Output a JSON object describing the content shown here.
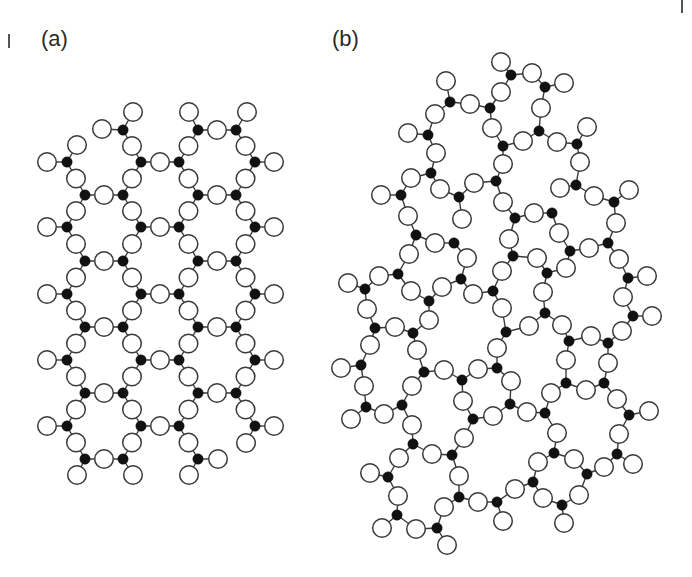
{
  "figure": {
    "panels": [
      {
        "id": "a",
        "label": "(a)",
        "title": "crystalline network",
        "label_pos": [
          41,
          28
        ]
      },
      {
        "id": "b",
        "label": "(b)",
        "title": "amorphous network",
        "label_pos": [
          332,
          28
        ]
      }
    ],
    "legend": {
      "filled_circle": "Si (network former)",
      "open_circle": "O (bridging/terminal)"
    },
    "style": {
      "oxygen_radius": 9.3,
      "silicon_radius": 5.2,
      "bond_color": "#3a3a3a",
      "silicon_color": "#111111",
      "oxygen_fill": "#ffffff"
    }
  },
  "panel_a": {
    "si": [
      [
        67,
        162
      ],
      [
        67,
        227
      ],
      [
        67,
        294
      ],
      [
        67,
        360
      ],
      [
        67,
        426
      ],
      [
        85,
        195
      ],
      [
        85,
        261
      ],
      [
        85,
        327
      ],
      [
        85,
        393
      ],
      [
        85,
        459
      ],
      [
        123,
        130
      ],
      [
        123,
        195
      ],
      [
        123,
        261
      ],
      [
        123,
        327
      ],
      [
        123,
        393
      ],
      [
        123,
        459
      ],
      [
        141,
        162
      ],
      [
        141,
        227
      ],
      [
        141,
        294
      ],
      [
        141,
        360
      ],
      [
        141,
        426
      ],
      [
        179,
        162
      ],
      [
        179,
        227
      ],
      [
        179,
        294
      ],
      [
        179,
        360
      ],
      [
        179,
        426
      ],
      [
        198,
        130
      ],
      [
        198,
        195
      ],
      [
        198,
        261
      ],
      [
        198,
        327
      ],
      [
        198,
        393
      ],
      [
        198,
        459
      ],
      [
        236,
        130
      ],
      [
        236,
        195
      ],
      [
        236,
        261
      ],
      [
        236,
        327
      ],
      [
        236,
        393
      ],
      [
        255,
        162
      ],
      [
        255,
        227
      ],
      [
        255,
        294
      ],
      [
        255,
        360
      ],
      [
        255,
        426
      ]
    ],
    "bonds": [
      [
        [
          85,
          195
        ],
        [
          123,
          195
        ]
      ],
      [
        [
          85,
          261
        ],
        [
          123,
          261
        ]
      ],
      [
        [
          85,
          327
        ],
        [
          123,
          327
        ]
      ],
      [
        [
          85,
          393
        ],
        [
          123,
          393
        ]
      ],
      [
        [
          85,
          459
        ],
        [
          123,
          459
        ]
      ],
      [
        [
          141,
          162
        ],
        [
          179,
          162
        ]
      ],
      [
        [
          141,
          227
        ],
        [
          179,
          227
        ]
      ],
      [
        [
          141,
          294
        ],
        [
          179,
          294
        ]
      ],
      [
        [
          141,
          360
        ],
        [
          179,
          360
        ]
      ],
      [
        [
          141,
          426
        ],
        [
          179,
          426
        ]
      ],
      [
        [
          198,
          130
        ],
        [
          236,
          130
        ]
      ],
      [
        [
          198,
          195
        ],
        [
          236,
          195
        ]
      ],
      [
        [
          198,
          261
        ],
        [
          236,
          261
        ]
      ],
      [
        [
          198,
          327
        ],
        [
          236,
          327
        ]
      ],
      [
        [
          198,
          393
        ],
        [
          236,
          393
        ]
      ],
      [
        [
          67,
          162
        ],
        [
          85,
          195
        ]
      ],
      [
        [
          85,
          195
        ],
        [
          67,
          227
        ]
      ],
      [
        [
          67,
          227
        ],
        [
          85,
          261
        ]
      ],
      [
        [
          85,
          261
        ],
        [
          67,
          294
        ]
      ],
      [
        [
          67,
          294
        ],
        [
          85,
          327
        ]
      ],
      [
        [
          85,
          327
        ],
        [
          67,
          360
        ]
      ],
      [
        [
          67,
          360
        ],
        [
          85,
          393
        ]
      ],
      [
        [
          85,
          393
        ],
        [
          67,
          426
        ]
      ],
      [
        [
          67,
          426
        ],
        [
          85,
          459
        ]
      ],
      [
        [
          123,
          130
        ],
        [
          141,
          162
        ]
      ],
      [
        [
          141,
          162
        ],
        [
          123,
          195
        ]
      ],
      [
        [
          123,
          195
        ],
        [
          141,
          227
        ]
      ],
      [
        [
          141,
          227
        ],
        [
          123,
          261
        ]
      ],
      [
        [
          123,
          261
        ],
        [
          141,
          294
        ]
      ],
      [
        [
          141,
          294
        ],
        [
          123,
          327
        ]
      ],
      [
        [
          123,
          327
        ],
        [
          141,
          360
        ]
      ],
      [
        [
          141,
          360
        ],
        [
          123,
          393
        ]
      ],
      [
        [
          123,
          393
        ],
        [
          141,
          426
        ]
      ],
      [
        [
          141,
          426
        ],
        [
          123,
          459
        ]
      ],
      [
        [
          198,
          130
        ],
        [
          179,
          162
        ]
      ],
      [
        [
          179,
          162
        ],
        [
          198,
          195
        ]
      ],
      [
        [
          198,
          195
        ],
        [
          179,
          227
        ]
      ],
      [
        [
          179,
          227
        ],
        [
          198,
          261
        ]
      ],
      [
        [
          198,
          261
        ],
        [
          179,
          294
        ]
      ],
      [
        [
          179,
          294
        ],
        [
          198,
          327
        ]
      ],
      [
        [
          198,
          327
        ],
        [
          179,
          360
        ]
      ],
      [
        [
          179,
          360
        ],
        [
          198,
          393
        ]
      ],
      [
        [
          198,
          393
        ],
        [
          179,
          426
        ]
      ],
      [
        [
          179,
          426
        ],
        [
          198,
          459
        ]
      ],
      [
        [
          236,
          130
        ],
        [
          255,
          162
        ]
      ],
      [
        [
          255,
          162
        ],
        [
          236,
          195
        ]
      ],
      [
        [
          236,
          195
        ],
        [
          255,
          227
        ]
      ],
      [
        [
          255,
          227
        ],
        [
          236,
          261
        ]
      ],
      [
        [
          236,
          261
        ],
        [
          255,
          294
        ]
      ],
      [
        [
          255,
          294
        ],
        [
          236,
          327
        ]
      ],
      [
        [
          236,
          327
        ],
        [
          255,
          360
        ]
      ],
      [
        [
          255,
          360
        ],
        [
          236,
          393
        ]
      ],
      [
        [
          236,
          393
        ],
        [
          255,
          426
        ]
      ]
    ],
    "terminal_o": [
      [
        [
          67,
          162
        ],
        [
          47,
          162
        ]
      ],
      [
        [
          67,
          162
        ],
        [
          77,
          145
        ]
      ],
      [
        [
          123,
          130
        ],
        [
          102,
          129
        ]
      ],
      [
        [
          123,
          130
        ],
        [
          133,
          112
        ]
      ],
      [
        [
          198,
          130
        ],
        [
          189,
          112
        ]
      ],
      [
        [
          236,
          130
        ],
        [
          247,
          112
        ]
      ],
      [
        [
          255,
          162
        ],
        [
          274,
          162
        ]
      ],
      [
        [
          67,
          227
        ],
        [
          47,
          227
        ]
      ],
      [
        [
          255,
          227
        ],
        [
          274,
          227
        ]
      ],
      [
        [
          67,
          294
        ],
        [
          47,
          294
        ]
      ],
      [
        [
          255,
          294
        ],
        [
          274,
          294
        ]
      ],
      [
        [
          67,
          360
        ],
        [
          47,
          360
        ]
      ],
      [
        [
          255,
          360
        ],
        [
          274,
          360
        ]
      ],
      [
        [
          67,
          426
        ],
        [
          47,
          426
        ]
      ],
      [
        [
          255,
          426
        ],
        [
          274,
          426
        ]
      ],
      [
        [
          255,
          426
        ],
        [
          246,
          443
        ]
      ],
      [
        [
          85,
          459
        ],
        [
          77,
          475
        ]
      ],
      [
        [
          123,
          459
        ],
        [
          133,
          475
        ]
      ],
      [
        [
          198,
          459
        ],
        [
          189,
          475
        ]
      ],
      [
        [
          198,
          459
        ],
        [
          218,
          459
        ]
      ]
    ]
  },
  "panel_b": {
    "bond_threshold": 25,
    "si": [
      [
        511,
        75
      ],
      [
        545,
        87
      ],
      [
        450,
        102
      ],
      [
        490,
        108
      ],
      [
        539,
        131
      ],
      [
        428,
        135
      ],
      [
        503,
        146
      ],
      [
        577,
        144
      ],
      [
        431,
        173
      ],
      [
        496,
        181
      ],
      [
        576,
        185
      ],
      [
        401,
        195
      ],
      [
        459,
        197
      ],
      [
        614,
        202
      ],
      [
        515,
        218
      ],
      [
        552,
        213
      ],
      [
        416,
        235
      ],
      [
        454,
        243
      ],
      [
        570,
        251
      ],
      [
        608,
        243
      ],
      [
        513,
        256
      ],
      [
        547,
        273
      ],
      [
        398,
        274
      ],
      [
        628,
        278
      ],
      [
        365,
        289
      ],
      [
        461,
        279
      ],
      [
        493,
        291
      ],
      [
        429,
        301
      ],
      [
        375,
        328
      ],
      [
        413,
        333
      ],
      [
        545,
        313
      ],
      [
        506,
        332
      ],
      [
        569,
        341
      ],
      [
        608,
        343
      ],
      [
        633,
        316
      ],
      [
        361,
        365
      ],
      [
        424,
        372
      ],
      [
        462,
        380
      ],
      [
        497,
        368
      ],
      [
        604,
        383
      ],
      [
        566,
        383
      ],
      [
        510,
        404
      ],
      [
        366,
        407
      ],
      [
        402,
        405
      ],
      [
        473,
        419
      ],
      [
        545,
        413
      ],
      [
        629,
        415
      ],
      [
        413,
        444
      ],
      [
        452,
        455
      ],
      [
        554,
        453
      ],
      [
        617,
        454
      ],
      [
        388,
        477
      ],
      [
        587,
        474
      ],
      [
        533,
        482
      ],
      [
        459,
        497
      ],
      [
        497,
        502
      ],
      [
        562,
        505
      ],
      [
        397,
        515
      ],
      [
        437,
        528
      ]
    ],
    "o": [
      [
        501,
        62
      ],
      [
        532,
        73
      ],
      [
        564,
        83
      ],
      [
        446,
        81
      ],
      [
        470,
        104
      ],
      [
        501,
        92
      ],
      [
        435,
        114
      ],
      [
        492,
        128
      ],
      [
        541,
        108
      ],
      [
        523,
        141
      ],
      [
        557,
        142
      ],
      [
        587,
        127
      ],
      [
        408,
        133
      ],
      [
        436,
        153
      ],
      [
        503,
        164
      ],
      [
        580,
        162
      ],
      [
        411,
        178
      ],
      [
        440,
        189
      ],
      [
        474,
        183
      ],
      [
        381,
        195
      ],
      [
        560,
        188
      ],
      [
        594,
        196
      ],
      [
        629,
        190
      ],
      [
        503,
        202
      ],
      [
        534,
        213
      ],
      [
        408,
        216
      ],
      [
        462,
        219
      ],
      [
        616,
        223
      ],
      [
        509,
        239
      ],
      [
        435,
        243
      ],
      [
        589,
        248
      ],
      [
        559,
        233
      ],
      [
        409,
        254
      ],
      [
        467,
        258
      ],
      [
        537,
        258
      ],
      [
        379,
        276
      ],
      [
        566,
        268
      ],
      [
        619,
        259
      ],
      [
        502,
        271
      ],
      [
        647,
        276
      ],
      [
        348,
        283
      ],
      [
        411,
        291
      ],
      [
        442,
        287
      ],
      [
        473,
        294
      ],
      [
        543,
        292
      ],
      [
        623,
        297
      ],
      [
        367,
        309
      ],
      [
        395,
        327
      ],
      [
        429,
        320
      ],
      [
        502,
        308
      ],
      [
        529,
        326
      ],
      [
        562,
        325
      ],
      [
        591,
        336
      ],
      [
        622,
        331
      ],
      [
        652,
        316
      ],
      [
        370,
        345
      ],
      [
        417,
        350
      ],
      [
        497,
        348
      ],
      [
        341,
        368
      ],
      [
        444,
        370
      ],
      [
        478,
        369
      ],
      [
        566,
        360
      ],
      [
        608,
        363
      ],
      [
        364,
        386
      ],
      [
        412,
        386
      ],
      [
        463,
        401
      ],
      [
        511,
        381
      ],
      [
        551,
        393
      ],
      [
        586,
        390
      ],
      [
        617,
        399
      ],
      [
        649,
        411
      ],
      [
        351,
        419
      ],
      [
        384,
        414
      ],
      [
        493,
        416
      ],
      [
        527,
        412
      ],
      [
        412,
        425
      ],
      [
        464,
        438
      ],
      [
        557,
        433
      ],
      [
        619,
        434
      ],
      [
        432,
        454
      ],
      [
        399,
        458
      ],
      [
        538,
        462
      ],
      [
        574,
        459
      ],
      [
        604,
        467
      ],
      [
        633,
        464
      ],
      [
        370,
        473
      ],
      [
        459,
        476
      ],
      [
        398,
        496
      ],
      [
        515,
        489
      ],
      [
        543,
        498
      ],
      [
        579,
        495
      ],
      [
        444,
        507
      ],
      [
        478,
        502
      ],
      [
        382,
        528
      ],
      [
        416,
        529
      ],
      [
        503,
        521
      ],
      [
        564,
        523
      ],
      [
        447,
        545
      ]
    ]
  },
  "edge_marks": [
    {
      "x": 8,
      "y": 34,
      "h": 14
    },
    {
      "x": 681,
      "y": 0,
      "h": 13
    }
  ]
}
